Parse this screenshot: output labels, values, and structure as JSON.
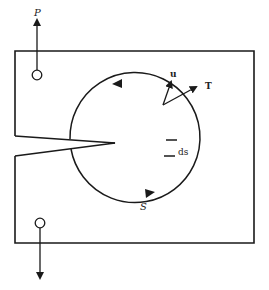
{
  "diagram": {
    "labels": {
      "load": "P",
      "displacement": "u",
      "traction": "T",
      "arc_element": "ds",
      "contour": "S"
    },
    "colors": {
      "stroke": "#1a1a1a",
      "background": "#ffffff"
    }
  }
}
